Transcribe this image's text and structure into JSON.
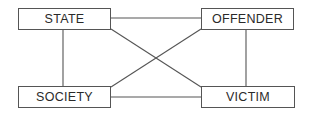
{
  "diagram": {
    "type": "relationship-square",
    "colors": {
      "line": "#555555",
      "text": "#2a2a2a",
      "background": "#ffffff"
    },
    "nodes": [
      {
        "id": "state",
        "label": "STATE",
        "position": "top-left"
      },
      {
        "id": "offender",
        "label": "OFFENDER",
        "position": "top-right"
      },
      {
        "id": "society",
        "label": "SOCIETY",
        "position": "bottom-left"
      },
      {
        "id": "victim",
        "label": "VICTIM",
        "position": "bottom-right"
      }
    ],
    "edges": [
      {
        "from": "state",
        "to": "offender",
        "style": "horizontal"
      },
      {
        "from": "society",
        "to": "victim",
        "style": "horizontal"
      },
      {
        "from": "state",
        "to": "society",
        "style": "vertical"
      },
      {
        "from": "offender",
        "to": "victim",
        "style": "vertical"
      },
      {
        "from": "state",
        "to": "victim",
        "style": "diagonal"
      },
      {
        "from": "offender",
        "to": "society",
        "style": "diagonal"
      }
    ]
  }
}
